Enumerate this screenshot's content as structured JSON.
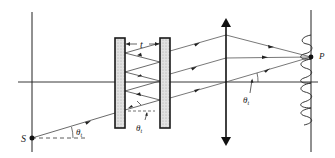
{
  "diagram": {
    "labels": {
      "source": "S",
      "point": "P",
      "gap": "t",
      "angle_symbol": "θ",
      "angle_subscript": "t"
    },
    "components": [
      {
        "id": "source-plane",
        "kind": "line"
      },
      {
        "id": "optical-axis",
        "kind": "line"
      },
      {
        "id": "plate-1",
        "kind": "partially-reflecting plate"
      },
      {
        "id": "plate-2",
        "kind": "partially-reflecting plate"
      },
      {
        "id": "lens",
        "kind": "converging lens"
      },
      {
        "id": "screen",
        "kind": "observation screen"
      },
      {
        "id": "fringe-pattern",
        "kind": "intensity profile"
      }
    ],
    "colors": {
      "ink": "#1a1a1a",
      "ray": "#555555",
      "plate_fill": "#d9d9d9"
    }
  }
}
